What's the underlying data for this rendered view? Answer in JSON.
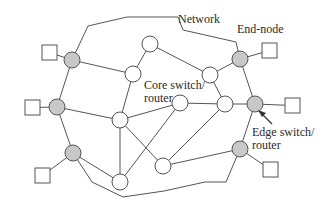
{
  "labels": {
    "network": "Network",
    "end_node": "End-node",
    "core_line1": "Core switch/",
    "core_line2": "router",
    "edge_line1": "Edge switch/",
    "edge_line2": "router"
  },
  "colors": {
    "line": "#555555",
    "edge_node_fill": "#c8c8c8",
    "core_node_fill": "#ffffff",
    "end_node_fill": "#ffffff"
  },
  "diagram": {
    "core_nodes": [
      {
        "id": "A",
        "x": 150,
        "y": 44
      },
      {
        "id": "B",
        "x": 133,
        "y": 74
      },
      {
        "id": "C",
        "x": 210,
        "y": 75
      },
      {
        "id": "D",
        "x": 180,
        "y": 103
      },
      {
        "id": "E",
        "x": 225,
        "y": 104
      },
      {
        "id": "F",
        "x": 120,
        "y": 120
      },
      {
        "id": "G",
        "x": 163,
        "y": 166
      },
      {
        "id": "H",
        "x": 120,
        "y": 182
      }
    ],
    "edge_nodes": [
      {
        "id": "E1",
        "x": 72,
        "y": 60
      },
      {
        "id": "E2",
        "x": 57,
        "y": 107
      },
      {
        "id": "E3",
        "x": 73,
        "y": 153
      },
      {
        "id": "E4",
        "x": 240,
        "y": 59
      },
      {
        "id": "E5",
        "x": 255,
        "y": 104
      },
      {
        "id": "E6",
        "x": 240,
        "y": 149
      }
    ],
    "end_nodes": [
      {
        "id": "T1",
        "attach": "E1",
        "x": 42,
        "y": 45
      },
      {
        "id": "T2",
        "attach": "E2",
        "x": 25,
        "y": 100
      },
      {
        "id": "T3",
        "attach": "E3",
        "x": 35,
        "y": 168
      },
      {
        "id": "T4",
        "attach": "E4",
        "x": 262,
        "y": 43
      },
      {
        "id": "T5",
        "attach": "E5",
        "x": 285,
        "y": 98
      },
      {
        "id": "T6",
        "attach": "E6",
        "x": 263,
        "y": 162
      }
    ],
    "links": [
      [
        "E1",
        "B"
      ],
      [
        "E1",
        "E2"
      ],
      [
        "E2",
        "F"
      ],
      [
        "E2",
        "E3"
      ],
      [
        "E3",
        "H"
      ],
      [
        "A",
        "B"
      ],
      [
        "A",
        "C"
      ],
      [
        "B",
        "F"
      ],
      [
        "C",
        "E4"
      ],
      [
        "C",
        "E"
      ],
      [
        "E4",
        "E5"
      ],
      [
        "E5",
        "E"
      ],
      [
        "D",
        "E"
      ],
      [
        "D",
        "F"
      ],
      [
        "D",
        "H"
      ],
      [
        "F",
        "H"
      ],
      [
        "F",
        "G"
      ],
      [
        "E",
        "G"
      ],
      [
        "G",
        "E6"
      ],
      [
        "E6",
        "E5"
      ]
    ]
  }
}
